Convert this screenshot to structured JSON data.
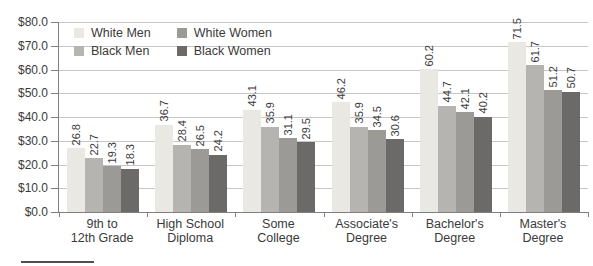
{
  "chart_data": {
    "type": "bar",
    "title": "",
    "xlabel": "",
    "ylabel": "",
    "categories": [
      "9th to\n12th Grade",
      "High School\nDiploma",
      "Some\nCollege",
      "Associate's\nDegree",
      "Bachelor's\nDegree",
      "Master's\nDegree"
    ],
    "series": [
      {
        "name": "White Men",
        "color": "#e9e8e3",
        "values": [
          26.8,
          36.7,
          43.1,
          46.2,
          60.2,
          71.5
        ]
      },
      {
        "name": "Black Men",
        "color": "#b5b4b1",
        "values": [
          22.7,
          28.4,
          35.9,
          35.9,
          44.7,
          61.7
        ]
      },
      {
        "name": "White Women",
        "color": "#9b9a97",
        "values": [
          19.3,
          26.5,
          31.1,
          34.5,
          42.1,
          51.2
        ]
      },
      {
        "name": "Black Women",
        "color": "#6b6a68",
        "values": [
          18.3,
          24.2,
          29.5,
          30.6,
          40.2,
          50.7
        ]
      }
    ],
    "ylim": [
      0,
      80
    ],
    "ytick_step": 10,
    "ytick_labels_top_down": [
      "$80.0",
      "$70.0",
      "$60.0",
      "$50.0",
      "$40.0",
      "$30.0",
      "$20.0",
      "$10.0",
      "$0.0"
    ],
    "value_labels": true,
    "value_label_format": "one-decimal",
    "grid": true,
    "legend": {
      "position": "top-left-inside",
      "columns": [
        [
          "White Men",
          "Black Men"
        ],
        [
          "White Women",
          "Black Women"
        ]
      ]
    },
    "colors": {
      "grid": "#c6c6c6",
      "axis": "#808080",
      "text": "#3a3a3a"
    }
  }
}
